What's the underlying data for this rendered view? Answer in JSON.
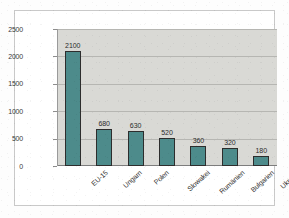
{
  "chart_data": {
    "type": "bar",
    "title": "",
    "subtitle": "",
    "xlabel": "",
    "ylabel": "",
    "categories": [
      "EU-15",
      "Ungarn",
      "Polen",
      "Slowakei",
      "Rumänien",
      "Bulgarien",
      "Ukraine"
    ],
    "values": [
      2100,
      680,
      630,
      520,
      360,
      320,
      180
    ],
    "data_labels": [
      "2100",
      "680",
      "630",
      "520",
      "360",
      "320",
      "180"
    ],
    "ylim": [
      0,
      2500
    ],
    "yticks": [
      0,
      500,
      1000,
      1500,
      2000,
      2500
    ],
    "ytick_labels": [
      "0",
      "500",
      "1000",
      "1500",
      "2000",
      "2500"
    ],
    "grid": true,
    "grid_axis": "y",
    "legend": false,
    "legend_position": "none",
    "series": [
      {
        "name": "",
        "values": [
          2100,
          680,
          630,
          520,
          360,
          320,
          180
        ]
      }
    ],
    "colors": {
      "bar_fill": "#4d8b8b",
      "bar_border": "#2d2d2d",
      "plot_background": "#d9d9d5",
      "gridline": "#b6b6b2",
      "axis": "#7d7d7d",
      "text": "#2c2c2c",
      "page_background": "#ffffff",
      "frame_border": "#c9c9c9"
    },
    "xtick_rotation_deg": -42
  }
}
